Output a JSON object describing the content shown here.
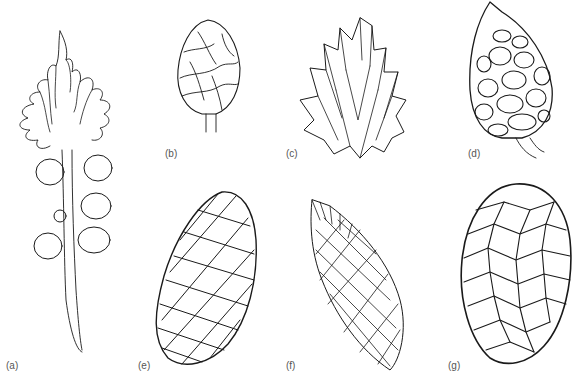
{
  "figure": {
    "panels": [
      {
        "id": "a",
        "label": "(a)",
        "subject": "shoot with leafy tip and attached ovules/seeds"
      },
      {
        "id": "b",
        "label": "(b)",
        "subject": "small ovoid cone with smooth scales"
      },
      {
        "id": "c",
        "label": "(c)",
        "subject": "cone with pointed lanceolate bracts"
      },
      {
        "id": "d",
        "label": "(d)",
        "subject": "conical cone with rounded hexagonal scales on stalk"
      },
      {
        "id": "e",
        "label": "(e)",
        "subject": "elongate cone with rhomboid scales"
      },
      {
        "id": "f",
        "label": "(f)",
        "subject": "elongate cone with spiny scale tips"
      },
      {
        "id": "g",
        "label": "(g)",
        "subject": "large cone with overlapping pointed scales"
      }
    ]
  },
  "colors": {
    "ink": "#1a1a1a",
    "label": "#555555",
    "background": "#ffffff"
  }
}
